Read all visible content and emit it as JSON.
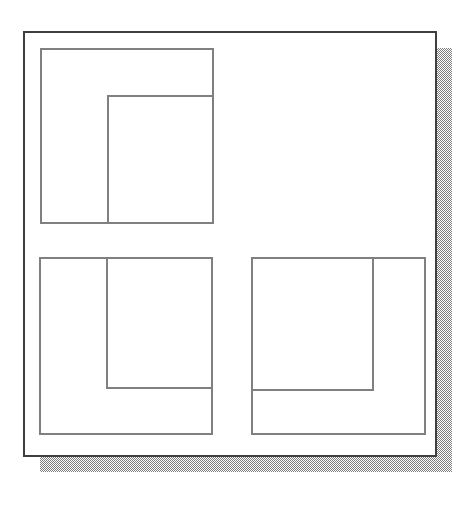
{
  "canvas": {
    "width": 474,
    "height": 505,
    "background_color": "#ffffff"
  },
  "diagram": {
    "title": "Nested rectangle layout diagram",
    "stroke_color_frame": "#3f3f3f",
    "stroke_color_inner": "#808080",
    "shadow_color": "#8a8a8a",
    "fill_color": "#ffffff"
  },
  "frame": {
    "label": "page-frame",
    "x": 24,
    "y": 32,
    "width": 412,
    "height": 424,
    "stroke_width": 2,
    "stroke": "#3f3f3f",
    "fill": "#ffffff"
  },
  "shadow": {
    "label": "drop-shadow",
    "offset_x": 16,
    "offset_y": 16,
    "color": "#8a8a8a",
    "pattern": "halftone-checker"
  },
  "groups": [
    {
      "name": "top-left-group",
      "outer": {
        "x": 41,
        "y": 49,
        "width": 172,
        "height": 174
      },
      "inner": {
        "x": 108,
        "y": 96,
        "width": 105,
        "height": 127
      },
      "shared_edges": "right,bottom"
    },
    {
      "name": "bottom-left-group",
      "outer": {
        "x": 40,
        "y": 258,
        "width": 172,
        "height": 176
      },
      "inner": {
        "x": 107,
        "y": 258,
        "width": 105,
        "height": 130
      },
      "shared_edges": "top,right"
    },
    {
      "name": "bottom-right-group",
      "outer": {
        "x": 252,
        "y": 258,
        "width": 173,
        "height": 176
      },
      "inner": {
        "x": 252,
        "y": 258,
        "width": 121,
        "height": 132
      },
      "shared_edges": "top,left"
    }
  ]
}
